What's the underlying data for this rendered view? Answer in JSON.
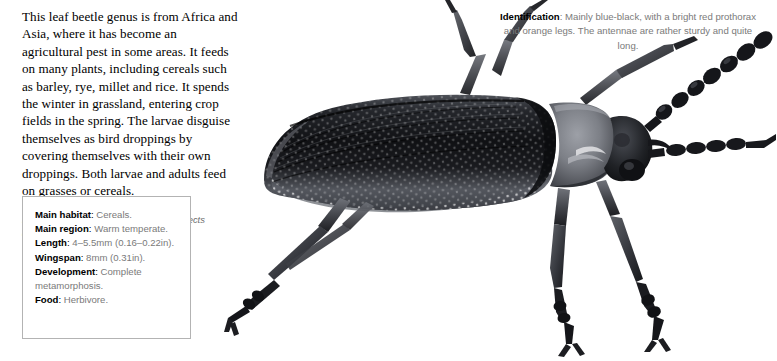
{
  "article": {
    "intro": "This leaf beetle genus is from Africa and Asia, where it has become an agricultural pest in some areas. It feeds on many plants, including cereals such as barley, rye, millet and rice. It spends the winter in grassland, entering crop fields in the spring. The larvae disguise themselves as bird droppings by covering themselves with their own droppings. Both larvae and adults feed on grasses or cereals.",
    "caption": "Right: In parts of its range this beetle affects cereal crops."
  },
  "fact_box": {
    "rows": [
      {
        "label": "Main habitat",
        "separator": ":",
        "value": "Cereals."
      },
      {
        "label": "Main region",
        "separator": ":",
        "value": "Warm temperate."
      },
      {
        "label": "Length",
        "separator": ":",
        "value": "4–5.5mm (0.16–0.22in)."
      },
      {
        "label": "Wingspan",
        "separator": ":",
        "value": "8mm (0.31in)."
      },
      {
        "label": "Development",
        "separator": ":",
        "value": "Complete metamorphosis."
      },
      {
        "label": "Food",
        "separator": ":",
        "value": "Herbivore."
      }
    ]
  },
  "identification": {
    "label": "Identification",
    "separator": ":",
    "text": "Mainly blue-black, with a bright red prothorax and orange legs. The antennae are rather sturdy and quite long."
  },
  "photo": {
    "subject": "leaf beetle specimen",
    "orientation": "head to the right",
    "palette": {
      "elytra_dark": "#15161a",
      "elytra_mid": "#3a3c42",
      "elytra_light": "#6b6e75",
      "prothorax": "#7e8188",
      "leg_dark": "#1b1c20",
      "leg_mid": "#4a4d54",
      "background": "#ffffff"
    }
  }
}
